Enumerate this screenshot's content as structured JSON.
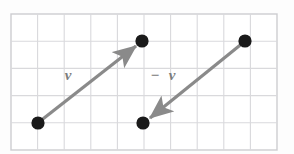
{
  "figure": {
    "background_color": "#fdfdfd",
    "grid": {
      "line_color": "#d7d7d9",
      "border_color": "#cfcfd2",
      "columns": 10,
      "rows": 5,
      "cell_width": 26.6,
      "cell_height": 27.2,
      "origin_x": 11,
      "origin_y": 14,
      "width": 266,
      "height": 136
    },
    "arrow_color": "#8a8a8a",
    "dot_color": "#1a1a1a",
    "dot_radius": 6.5,
    "vectors": [
      {
        "name": "v",
        "label": "v",
        "label_prefix": "",
        "label_x": 68,
        "label_y": 80,
        "start_x": 38,
        "start_y": 123,
        "end_x": 142,
        "end_y": 41,
        "direction": "up-right"
      },
      {
        "name": "minus-v",
        "label": "v",
        "label_prefix": "−",
        "label_x": 171,
        "label_y": 80,
        "prefix_x": 152,
        "prefix_y": 80,
        "start_x": 245,
        "start_y": 41,
        "end_x": 143,
        "end_y": 123,
        "direction": "down-left"
      }
    ],
    "points": [
      {
        "name": "point-lower-left",
        "x": 38,
        "y": 123
      },
      {
        "name": "point-upper-middle",
        "x": 142,
        "y": 41
      },
      {
        "name": "point-lower-middle",
        "x": 143,
        "y": 123
      },
      {
        "name": "point-upper-right",
        "x": 245,
        "y": 41
      }
    ]
  }
}
